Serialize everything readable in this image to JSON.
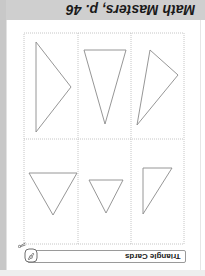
{
  "header": {
    "title": "Math Masters, p. 46",
    "band_color": "#cfcfcf"
  },
  "footer": {
    "label": "Triangle Cards",
    "icon": "pencil-badge-icon",
    "cut_icon": "scissors-icon"
  },
  "orientation": "rotated-180",
  "grid": {
    "rows": 2,
    "cols": 3,
    "line_style": "dotted",
    "line_color": "#b8b8b8",
    "bounds": {
      "x1": 24,
      "y1": 33,
      "x2": 184,
      "y2": 244
    },
    "col_dividers_x": [
      78,
      131
    ],
    "row_divider_y": 139
  },
  "cards": [
    {
      "id": 1,
      "row": 0,
      "col": 0,
      "shape": "triangle",
      "points": "36,42 71,87 36,132"
    },
    {
      "id": 2,
      "row": 0,
      "col": 1,
      "shape": "triangle",
      "points": "84,50 126,50 105,124"
    },
    {
      "id": 3,
      "row": 0,
      "col": 2,
      "shape": "triangle",
      "points": "150,50 178,75 137,125"
    },
    {
      "id": 4,
      "row": 1,
      "col": 0,
      "shape": "triangle",
      "points": "29,173 77,173 53,215"
    },
    {
      "id": 5,
      "row": 1,
      "col": 1,
      "shape": "triangle",
      "points": "89,180 123,180 106,213"
    },
    {
      "id": 6,
      "row": 1,
      "col": 2,
      "shape": "triangle",
      "points": "143,168 172,168 143,214"
    }
  ],
  "colors": {
    "triangle_stroke": "#8a8a8a",
    "text": "#1a1a1a"
  }
}
